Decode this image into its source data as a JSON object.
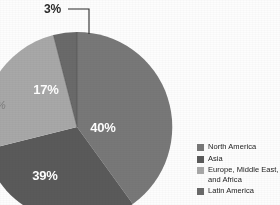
{
  "chart_data": {
    "type": "pie",
    "title": "",
    "categories": [
      "North America",
      "Asia",
      "Europe, Middle East, and Africa",
      "Latin America"
    ],
    "values": [
      40,
      39,
      17,
      3
    ],
    "labels": [
      "40%",
      "39%",
      "17%",
      "3%"
    ],
    "unit": "percent",
    "legend_position": "bottom-right",
    "grid": false,
    "start_angle_deg": 0,
    "direction": "clockwise",
    "colors": [
      "#787878",
      "#5a5a5a",
      "#a8a8a8",
      "#6a6a6a"
    ]
  },
  "slices": [
    {
      "name": "North America",
      "label": "40%",
      "value": 40,
      "color": "#787878",
      "label_x": 131,
      "label_y": 110
    },
    {
      "name": "Asia",
      "label": "39%",
      "value": 39,
      "color": "#5a5a5a",
      "label_x": 73,
      "label_y": 158
    },
    {
      "name": "Europe, Middle East, and Africa",
      "label": "17%",
      "value": 17,
      "color": "#a8a8a8",
      "label_x": 74,
      "label_y": 72
    },
    {
      "name": "Latin America",
      "label": "3%",
      "value": 3,
      "color": "#6a6a6a",
      "label_x": 0,
      "label_y": 0
    }
  ],
  "callout": {
    "label": "3%"
  },
  "left_edge_fragment": {
    "text": "%"
  },
  "legend": {
    "entries": [
      {
        "label": "North America",
        "label_line2": "",
        "color": "#787878"
      },
      {
        "label": "Asia",
        "label_line2": "",
        "color": "#5a5a5a"
      },
      {
        "label": "Europe, Middle East,",
        "label_line2": "and Africa",
        "color": "#a8a8a8"
      },
      {
        "label": "Latin America",
        "label_line2": "",
        "color": "#6a6a6a"
      }
    ]
  }
}
